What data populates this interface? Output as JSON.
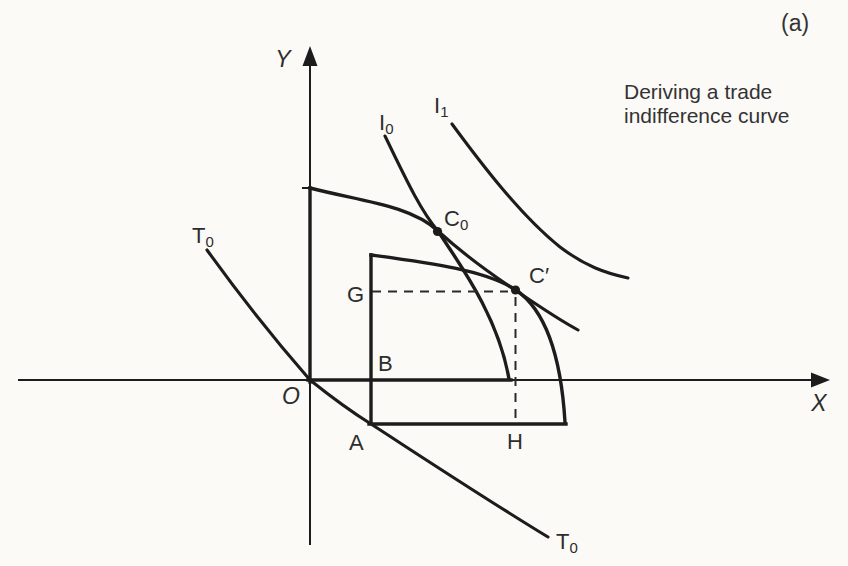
{
  "panel_label": "(a)",
  "caption": {
    "line1": "Deriving a trade",
    "line2": "indifference curve"
  },
  "axis": {
    "y_label": "Y",
    "x_label": "X",
    "origin_label": "O"
  },
  "curve_labels": {
    "trade_top": {
      "main": "T",
      "sub": "0"
    },
    "trade_bottom": {
      "main": "T",
      "sub": "0"
    },
    "indifference_0": {
      "main": "I",
      "sub": "0"
    },
    "indifference_1": {
      "main": "I",
      "sub": "1"
    }
  },
  "point_labels": {
    "c0": {
      "main": "C",
      "sub": "0"
    },
    "c_prime": "C′",
    "g": "G",
    "b": "B",
    "a": "A",
    "h": "H"
  },
  "colors": {
    "ink": "#1c1c1c",
    "text": "#2d2d2d",
    "background": "#fbfaf7"
  }
}
